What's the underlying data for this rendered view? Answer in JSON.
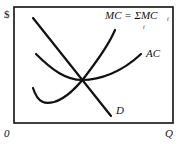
{
  "diagram": {
    "type": "economics-cost-curves",
    "y_axis_label": "$",
    "x_axis_label": "Q",
    "origin_label": "0",
    "curves": [
      {
        "id": "mc",
        "label": "MC = ΣMC",
        "subscript_sum": "i",
        "subscript_term": "i",
        "shape": "U-shaped, rising steeply"
      },
      {
        "id": "ac",
        "label": "AC",
        "shape": "U-shaped, flatter"
      },
      {
        "id": "d",
        "label": "D",
        "shape": "downward-sloping line"
      }
    ],
    "note": "MC, AC and D intersect at a single point (minimum of AC)"
  }
}
